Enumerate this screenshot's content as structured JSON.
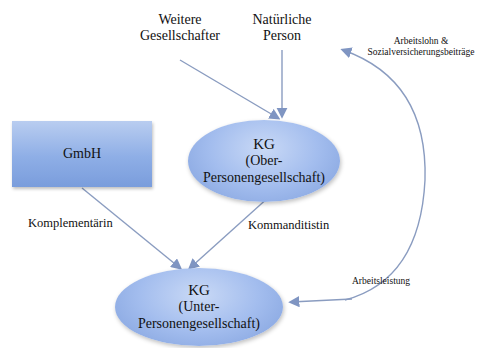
{
  "diagram": {
    "nodes": {
      "weitere_gesellschafter": {
        "line1": "Weitere",
        "line2": "Gesellschafter"
      },
      "natuerliche_person": {
        "line1": "Natürliche",
        "line2": "Person"
      },
      "gmbh": {
        "label": "GmbH"
      },
      "kg_ober": {
        "title": "KG",
        "line1": "(Ober-",
        "line2": "Personengesellschaft)"
      },
      "kg_unter": {
        "title": "KG",
        "line1": "(Unter-",
        "line2": "Personengesellschaft)"
      }
    },
    "edge_labels": {
      "komplementaerin": "Komplementärin",
      "kommanditistin": "Kommanditistin",
      "arbeitslohn_line1": "Arbeitslohn &",
      "arbeitslohn_line2": "Sozialversicherungsbeiträge",
      "arbeitsleistung": "Arbeitsleistung"
    },
    "colors": {
      "node_fill": "#a3bdee",
      "edge": "#8a9cc0"
    }
  }
}
